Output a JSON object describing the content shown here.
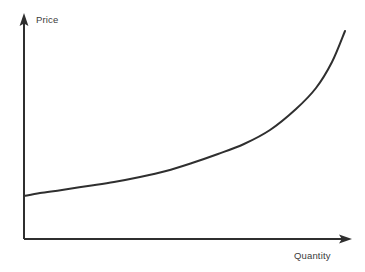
{
  "figure": {
    "background_color": "#ffffff",
    "ink_color": "#2f2f2f",
    "label_color": "#3b3b3b",
    "width": 365,
    "height": 272
  },
  "axes": {
    "y": {
      "label": "Price",
      "arrow_icon": "arrow-up-icon",
      "origin": [
        24,
        239
      ],
      "tip": [
        24,
        13
      ]
    },
    "x": {
      "label": "Quantity",
      "arrow_icon": "arrow-right-icon",
      "origin": [
        24,
        239
      ],
      "tip": [
        352,
        239
      ]
    }
  },
  "chart_data": {
    "type": "line",
    "title": "",
    "xlabel": "Quantity",
    "ylabel": "Price",
    "xlim": [
      0,
      100
    ],
    "ylim": [
      0,
      100
    ],
    "grid": false,
    "legend": null,
    "axis_ticks": {
      "x": [],
      "y": []
    },
    "series": [
      {
        "name": "Supply",
        "shape": "convex-increasing",
        "x": [
          0,
          5,
          12,
          20,
          28,
          36,
          44,
          52,
          60,
          68,
          76,
          84,
          90,
          95,
          100
        ],
        "y": [
          19,
          21,
          23,
          25,
          27,
          30,
          33,
          37,
          41,
          46,
          52,
          62,
          72,
          83,
          92
        ],
        "points_px": [
          [
            24,
            196
          ],
          [
            40,
            193
          ],
          [
            62,
            190
          ],
          [
            88,
            186
          ],
          [
            114,
            182
          ],
          [
            140,
            177
          ],
          [
            166,
            171
          ],
          [
            192,
            163
          ],
          [
            218,
            154
          ],
          [
            244,
            144
          ],
          [
            270,
            130
          ],
          [
            296,
            109
          ],
          [
            316,
            88
          ],
          [
            332,
            62
          ],
          [
            345,
            31
          ]
        ]
      }
    ],
    "annotations": []
  }
}
